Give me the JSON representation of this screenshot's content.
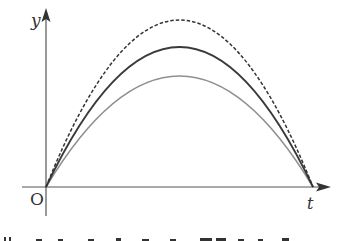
{
  "diagram": {
    "axes": {
      "y_label": "y",
      "x_label": "t",
      "origin_label": "O"
    },
    "colors": {
      "axis": "#444444",
      "dashed_curve": "#333333",
      "dark_curve": "#333333",
      "light_curve": "#8a8a8a",
      "background": "#ffffff"
    },
    "curves": [
      {
        "name": "dashed-curve",
        "style": "dashed",
        "start": [
          46,
          187
        ],
        "peak": [
          180,
          20
        ],
        "end": [
          313,
          187
        ]
      },
      {
        "name": "dark-solid-curve",
        "style": "solid",
        "start": [
          46,
          187
        ],
        "peak": [
          180,
          47
        ],
        "end": [
          313,
          187
        ]
      },
      {
        "name": "light-solid-curve",
        "style": "solid-gray",
        "start": [
          46,
          187
        ],
        "peak": [
          180,
          76
        ],
        "end": [
          313,
          187
        ]
      }
    ],
    "caption_fragment": "(cut-off text)"
  }
}
